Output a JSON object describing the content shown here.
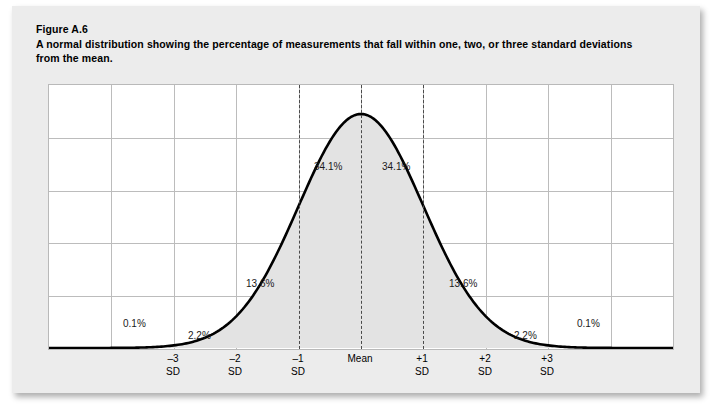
{
  "figure": {
    "number": "Figure A.6",
    "caption_line1": "A normal distribution showing the percentage of measurements that fall within one, two, or three standard deviations",
    "caption_line2": "from the mean."
  },
  "colors": {
    "card_background": "#ececec",
    "plot_background": "#ffffff",
    "grid_line": "#bcbcbc",
    "curve_stroke": "#000000",
    "curve_fill": "#e3e3e3",
    "dashed_line": "#4a4a4a",
    "page_background": "#ffffff"
  },
  "chart_data": {
    "type": "area",
    "title": "A normal distribution showing the percentage of measurements that fall within one, two, or three standard deviations from the mean.",
    "xlabel": "",
    "ylabel": "",
    "grid": true,
    "legend": "none",
    "xlim": [
      -5,
      5
    ],
    "ylim": [
      0,
      1
    ],
    "x_ticks": [
      {
        "value": -3,
        "line1": "–3",
        "line2": "SD"
      },
      {
        "value": -2,
        "line1": "–2",
        "line2": "SD"
      },
      {
        "value": -1,
        "line1": "–1",
        "line2": "SD"
      },
      {
        "value": 0,
        "line1": "Mean",
        "line2": ""
      },
      {
        "value": 1,
        "line1": "+1",
        "line2": "SD"
      },
      {
        "value": 2,
        "line1": "+2",
        "line2": "SD"
      },
      {
        "value": 3,
        "line1": "+3",
        "line2": "SD"
      }
    ],
    "dashed_markers": [
      -1,
      0,
      1
    ],
    "region_labels": [
      {
        "label": "0.1%",
        "range": [
          -4,
          -3
        ],
        "x_center": -3.55,
        "y": 0.115
      },
      {
        "label": "2.2%",
        "range": [
          -3,
          -2
        ],
        "x_center": -2.5,
        "y": 0.115
      },
      {
        "label": "13.6%",
        "range": [
          -2,
          -1
        ],
        "x_center": -1.5,
        "y": 0.31
      },
      {
        "label": "34.1%",
        "range": [
          -1,
          0
        ],
        "x_center": -0.5,
        "y": 0.66
      },
      {
        "label": "34.1%",
        "range": [
          0,
          1
        ],
        "x_center": 0.5,
        "y": 0.66
      },
      {
        "label": "13.6%",
        "range": [
          1,
          2
        ],
        "x_center": 1.5,
        "y": 0.31
      },
      {
        "label": "2.2%",
        "range": [
          2,
          3
        ],
        "x_center": 2.5,
        "y": 0.115
      },
      {
        "label": "0.1%",
        "range": [
          3,
          4
        ],
        "x_center": 3.55,
        "y": 0.115
      }
    ],
    "series": [
      {
        "name": "normal distribution",
        "mean": 0,
        "sd": 1,
        "fill": "#e3e3e3",
        "stroke": "#000000"
      }
    ],
    "gridlines": {
      "vertical_count": 9,
      "horizontal_count": 4
    }
  }
}
